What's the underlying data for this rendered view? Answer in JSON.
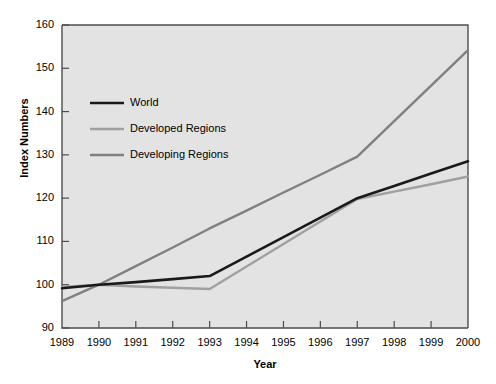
{
  "chart_data": {
    "type": "line",
    "title": "",
    "xlabel": "Year",
    "ylabel": "Index Numbers",
    "x": [
      1989,
      1990,
      1991,
      1992,
      1993,
      1994,
      1995,
      1996,
      1997,
      1998,
      1999,
      2000
    ],
    "categories": [
      "1989",
      "1990",
      "1991",
      "1992",
      "1993",
      "1994",
      "1995",
      "1996",
      "1997",
      "1998",
      "1999",
      "2000"
    ],
    "xlim": [
      1989,
      2000
    ],
    "ylim": [
      90,
      160
    ],
    "yticks": [
      90,
      100,
      110,
      120,
      130,
      140,
      150,
      160
    ],
    "ytick_labels": [
      "90",
      "100",
      "110",
      "120",
      "130",
      "140",
      "150",
      "160"
    ],
    "xticks": [
      1989,
      1990,
      1991,
      1992,
      1993,
      1994,
      1995,
      1996,
      1997,
      1998,
      1999,
      2000
    ],
    "grid": false,
    "legend_position": "upper left inside",
    "series": [
      {
        "name": "World",
        "color": "#1a1a1a",
        "width": 2.6,
        "values": [
          99.2,
          100.0,
          100.6,
          101.3,
          102.0,
          106.5,
          111.0,
          115.5,
          120.0,
          122.8,
          125.7,
          128.5
        ]
      },
      {
        "name": "Developed Regions",
        "color": "#a0a0a0",
        "width": 2.4,
        "values": [
          99.5,
          100.0,
          99.6,
          99.3,
          99.0,
          104.2,
          109.4,
          114.6,
          119.8,
          121.5,
          123.2,
          125.0
        ]
      },
      {
        "name": "Developing Regions",
        "color": "#808080",
        "width": 2.4,
        "values": [
          96.2,
          100.0,
          104.3,
          108.6,
          113.0,
          117.1,
          121.3,
          125.4,
          129.6,
          137.8,
          146.0,
          154.2
        ]
      }
    ]
  },
  "legend": {
    "items": [
      {
        "label": "World"
      },
      {
        "label": "Developed Regions"
      },
      {
        "label": "Developing Regions"
      }
    ]
  },
  "axes": {
    "y_title": "Index Numbers",
    "x_title": "Year"
  },
  "style": {
    "plot_background": "#e3e3e3",
    "axis_color": "#4d4d4d",
    "page_background": "#ffffff"
  }
}
